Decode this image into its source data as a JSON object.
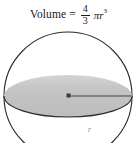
{
  "figure": {
    "caption_formula": {
      "label": "Volume",
      "equals": "=",
      "numerator": "4",
      "denominator": "3",
      "pi": "π",
      "variable": "r",
      "exponent": "3",
      "plain_text": "Volume = 4/3 πr³"
    },
    "diagram": {
      "shape": "sphere",
      "description": "Sphere with shaded equatorial disk and labeled radius",
      "radius_label": "r",
      "colors": {
        "outline": "#2b2b2b",
        "disk_fill": "#c2c2c2",
        "disk_edge": "#2b2b2b",
        "radius_line": "#6e6e6e",
        "center_dot": "#3a3a3a",
        "background": "#ffffff"
      },
      "geometry": {
        "circle_center_x": 68,
        "circle_center_y": 96,
        "circle_radius": 64,
        "ellipse_center_x": 68,
        "ellipse_center_y": 96,
        "ellipse_rx": 64,
        "ellipse_ry": 21
      }
    }
  }
}
